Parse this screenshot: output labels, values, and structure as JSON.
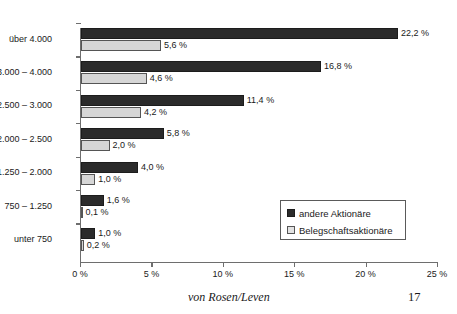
{
  "chart_data": {
    "type": "bar",
    "orientation": "horizontal",
    "title": "",
    "xlabel": "",
    "ylabel": "",
    "xlim": [
      0,
      25
    ],
    "xticks": [
      "0 %",
      "5 %",
      "10 %",
      "15 %",
      "20 %",
      "25 %"
    ],
    "xtick_values": [
      0,
      5,
      10,
      15,
      20,
      25
    ],
    "grid": false,
    "legend_position": "inside-lower-right",
    "categories": [
      "über 4.000",
      "3.000 – 4.000",
      "2.500 – 3.000",
      "2.000 – 2.500",
      "1.250 – 2.000",
      "750 – 1.250",
      "unter 750"
    ],
    "series": [
      {
        "name": "andere Aktionäre",
        "color": "#2b2b2b",
        "values": [
          22.2,
          16.8,
          11.4,
          5.8,
          4.0,
          1.6,
          1.0
        ],
        "labels": [
          "22,2 %",
          "16,8 %",
          "11,4 %",
          "5,8 %",
          "4,0 %",
          "1,6 %",
          "1,0 %"
        ]
      },
      {
        "name": "Belegschaftsaktionäre",
        "color": "#d6d6d6",
        "values": [
          5.6,
          4.6,
          4.2,
          2.0,
          1.0,
          0.1,
          0.2
        ],
        "labels": [
          "5,6 %",
          "4,6 %",
          "4,2 %",
          "2,0 %",
          "1,0 %",
          "0,1 %",
          "0,2 %"
        ]
      }
    ]
  },
  "legend": {
    "items": [
      {
        "label": "andere Aktionäre",
        "swatch": "dark"
      },
      {
        "label": "Belegschaftsaktionäre",
        "swatch": "light"
      }
    ]
  },
  "footer": {
    "source": "von Rosen/Leven",
    "page_number": "17"
  }
}
